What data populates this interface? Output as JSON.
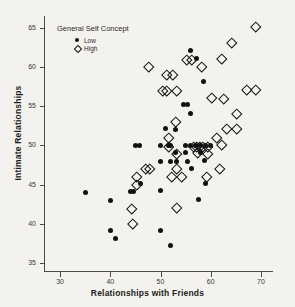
{
  "chart_data": {
    "type": "scatter",
    "title": "",
    "xlabel": "Relationships with Friends",
    "ylabel": "Intimate Relationships",
    "xlim": [
      27,
      72
    ],
    "ylim": [
      34,
      66.5
    ],
    "xticks": [
      30,
      40,
      50,
      60,
      70
    ],
    "yticks": [
      35,
      40,
      45,
      50,
      55,
      60,
      65
    ],
    "grid": false,
    "legend": {
      "title": "General Self Concept",
      "position": "top-left-inside",
      "entries": [
        {
          "label": "Low",
          "marker": "filled-circle",
          "color": "#111111"
        },
        {
          "label": "High",
          "marker": "open-diamond",
          "color": "#111111"
        }
      ]
    },
    "series": [
      {
        "name": "Low",
        "marker": "filled-circle",
        "color": "#111111",
        "points": [
          [
            35,
            44.0
          ],
          [
            40,
            43.0
          ],
          [
            40,
            39.2
          ],
          [
            41,
            38.2
          ],
          [
            44,
            44.1
          ],
          [
            44.6,
            44.1
          ],
          [
            45,
            50.0
          ],
          [
            45.8,
            50.0
          ],
          [
            46,
            45.2
          ],
          [
            50,
            50.0
          ],
          [
            50,
            48.0
          ],
          [
            50,
            44.2
          ],
          [
            50,
            39.2
          ],
          [
            51,
            52.1
          ],
          [
            51.5,
            50.0
          ],
          [
            52,
            50.0
          ],
          [
            52,
            48.0
          ],
          [
            52,
            37.2
          ],
          [
            53,
            52.0
          ],
          [
            53,
            49.1
          ],
          [
            53.2,
            48.0
          ],
          [
            54.5,
            55.2
          ],
          [
            55.3,
            55.2
          ],
          [
            55,
            50.0
          ],
          [
            55,
            49.1
          ],
          [
            55.3,
            48.0
          ],
          [
            56,
            62.1
          ],
          [
            56,
            54.1
          ],
          [
            56,
            50.0
          ],
          [
            56.2,
            47.1
          ],
          [
            57,
            50.0
          ],
          [
            57.2,
            61.1
          ],
          [
            58,
            50.0
          ],
          [
            58,
            49.1
          ],
          [
            58.5,
            58.1
          ],
          [
            58.8,
            48.1
          ],
          [
            59,
            50.0
          ],
          [
            59,
            45.2
          ],
          [
            57.5,
            43.1
          ],
          [
            60,
            50.0
          ]
        ]
      },
      {
        "name": "High",
        "marker": "open-diamond",
        "color": "#111111",
        "points": [
          [
            44,
            42.1
          ],
          [
            44.2,
            40.1
          ],
          [
            45,
            46.1
          ],
          [
            45,
            45.1
          ],
          [
            46.8,
            47.1
          ],
          [
            47.6,
            47.1
          ],
          [
            47.5,
            60.1
          ],
          [
            50.2,
            57.1
          ],
          [
            51,
            57.1
          ],
          [
            51,
            59.1
          ],
          [
            52.2,
            59.1
          ],
          [
            51.5,
            51.1
          ],
          [
            51.4,
            50.0
          ],
          [
            52,
            46.1
          ],
          [
            52.8,
            53.1
          ],
          [
            53,
            57.1
          ],
          [
            53,
            49.1
          ],
          [
            53,
            47.1
          ],
          [
            53,
            42.2
          ],
          [
            54,
            46.1
          ],
          [
            55,
            61.1
          ],
          [
            56,
            61.1
          ],
          [
            56.4,
            50.0
          ],
          [
            57,
            50.0
          ],
          [
            57.6,
            50.0
          ],
          [
            57.2,
            49.2
          ],
          [
            58,
            60.2
          ],
          [
            58.3,
            50.0
          ],
          [
            59.2,
            50.0
          ],
          [
            59.2,
            49.1
          ],
          [
            59,
            46.1
          ],
          [
            60,
            56.2
          ],
          [
            61,
            51.1
          ],
          [
            61.5,
            47.1
          ],
          [
            62,
            61.2
          ],
          [
            62.3,
            56.1
          ],
          [
            62,
            50.2
          ],
          [
            63,
            52.2
          ],
          [
            64,
            63.2
          ],
          [
            65,
            54.2
          ],
          [
            65,
            52.2
          ],
          [
            67,
            57.2
          ],
          [
            68.8,
            57.2
          ],
          [
            68.8,
            65.2
          ]
        ]
      }
    ]
  }
}
